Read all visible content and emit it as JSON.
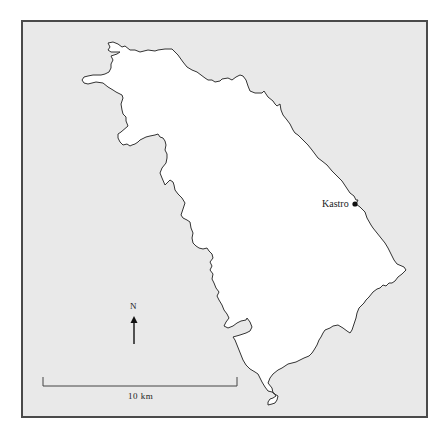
{
  "map": {
    "background_color": "#e9e9e9",
    "land_color": "#ffffff",
    "outline_color": "#333333",
    "frame_color": "#4a4a4a",
    "places": [
      {
        "name": "Kastro",
        "symbol": "filled-circle"
      }
    ],
    "north_arrow": {
      "label": "N"
    },
    "scale_bar": {
      "label": "10 km"
    }
  }
}
